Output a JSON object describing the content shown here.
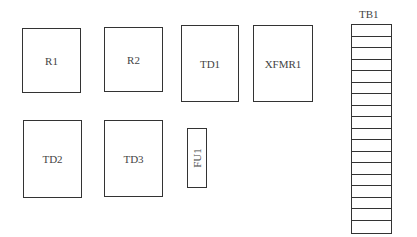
{
  "diagram": {
    "type": "panel-layout",
    "components": [
      {
        "id": "R1",
        "label": "R1",
        "x": 22,
        "y": 28,
        "w": 59,
        "h": 65
      },
      {
        "id": "R2",
        "label": "R2",
        "x": 104,
        "y": 27,
        "w": 59,
        "h": 65
      },
      {
        "id": "TD1",
        "label": "TD1",
        "x": 181,
        "y": 25,
        "w": 58,
        "h": 77
      },
      {
        "id": "XFMR1",
        "label": "XFMR1",
        "x": 253,
        "y": 25,
        "w": 60,
        "h": 77
      },
      {
        "id": "TD2",
        "label": "TD2",
        "x": 23,
        "y": 120,
        "w": 59,
        "h": 78
      },
      {
        "id": "TD3",
        "label": "TD3",
        "x": 104,
        "y": 120,
        "w": 59,
        "h": 77
      },
      {
        "id": "FU1",
        "label": "FU1",
        "x": 187,
        "y": 128,
        "w": 20,
        "h": 60,
        "rotated": true
      }
    ],
    "terminal_block": {
      "label": "TB1",
      "x": 351,
      "y": 24,
      "w": 41,
      "h": 210,
      "rows": 18
    },
    "colors": {
      "line": "#333333",
      "background": "#ffffff",
      "text": "#444444"
    }
  }
}
